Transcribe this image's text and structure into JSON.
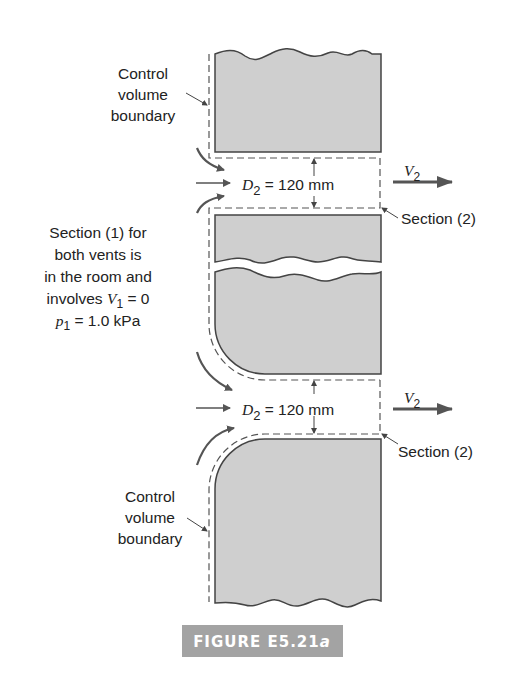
{
  "figure": {
    "caption": "FIGURE E5.21",
    "caption_suffix": "a",
    "caption_bg": "#a3a3a3"
  },
  "labels": {
    "control_volume_top": [
      "Control",
      "volume",
      "boundary"
    ],
    "control_volume_bottom": [
      "Control",
      "volume",
      "boundary"
    ],
    "section1_note": [
      "Section (1) for",
      "both vents is",
      "in the room and"
    ],
    "section1_v_prefix": "involves ",
    "section1_v_var": "V",
    "section1_v_sub": "1",
    "section1_v_rest": " = 0",
    "section1_p_var": "p",
    "section1_p_sub": "1",
    "section1_p_rest": " = 1.0 kPa",
    "section2_top": "Section (2)",
    "section2_bottom": "Section (2)"
  },
  "vents": [
    {
      "d_var": "D",
      "d_sub": "2",
      "d_rest": " = 120 mm",
      "v_var": "V",
      "v_sub": "2"
    },
    {
      "d_var": "D",
      "d_sub": "2",
      "d_rest": " = 120 mm",
      "v_var": "V",
      "v_sub": "2"
    }
  ],
  "colors": {
    "wall_fill": "#cfcfcf",
    "wall_stroke": "#444444",
    "arrow": "#555555"
  }
}
